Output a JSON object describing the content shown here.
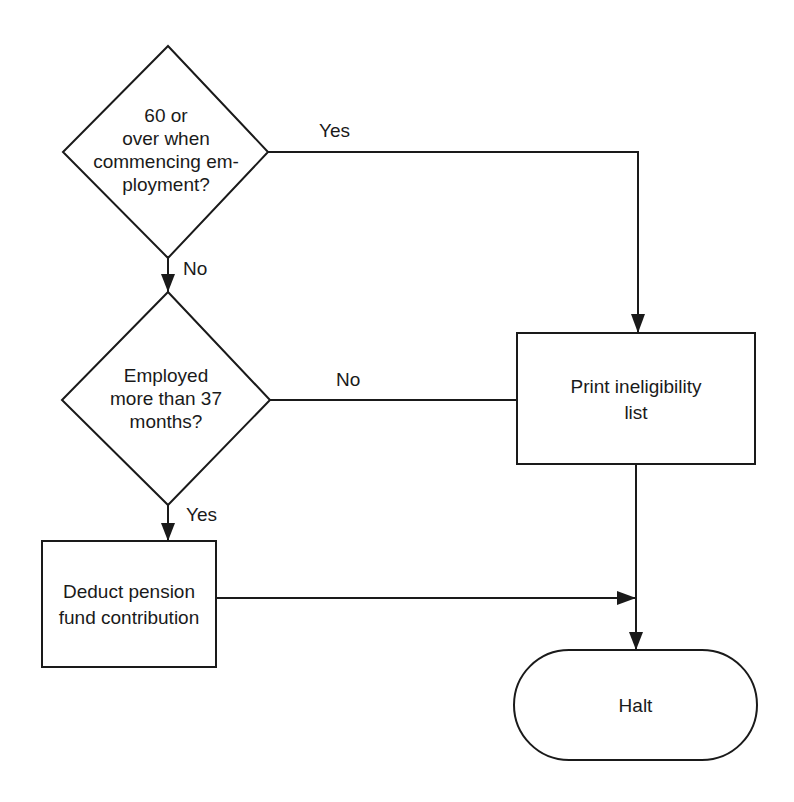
{
  "diagram": {
    "type": "flowchart",
    "nodes": [
      {
        "id": "decision_age",
        "shape": "diamond",
        "text": "60 or\nover when\ncommencing em-\nployment?"
      },
      {
        "id": "decision_tenure",
        "shape": "diamond",
        "text": "Employed\nmore than 37\nmonths?"
      },
      {
        "id": "process_deduct",
        "shape": "rectangle",
        "text": "Deduct pension\nfund contribution"
      },
      {
        "id": "process_print",
        "shape": "rectangle",
        "text": "Print ineligibility\nlist"
      },
      {
        "id": "terminal_halt",
        "shape": "terminal",
        "text": "Halt"
      }
    ],
    "edges": [
      {
        "from": "decision_age",
        "to": "process_print",
        "label": "Yes"
      },
      {
        "from": "decision_age",
        "to": "decision_tenure",
        "label": "No"
      },
      {
        "from": "decision_tenure",
        "to": "process_print",
        "label": "No"
      },
      {
        "from": "decision_tenure",
        "to": "process_deduct",
        "label": "Yes"
      },
      {
        "from": "process_deduct",
        "to": "terminal_halt",
        "label": ""
      },
      {
        "from": "process_print",
        "to": "terminal_halt",
        "label": ""
      }
    ]
  },
  "labels": {
    "age_question": "60 or\nover when\ncommencing em-\nployment?",
    "tenure_question": "Employed\nmore than 37\nmonths?",
    "deduct": "Deduct pension\nfund contribution",
    "print": "Print ineligibility\nlist",
    "halt": "Halt",
    "age_yes": "Yes",
    "age_no": "No",
    "tenure_no": "No",
    "tenure_yes": "Yes"
  }
}
